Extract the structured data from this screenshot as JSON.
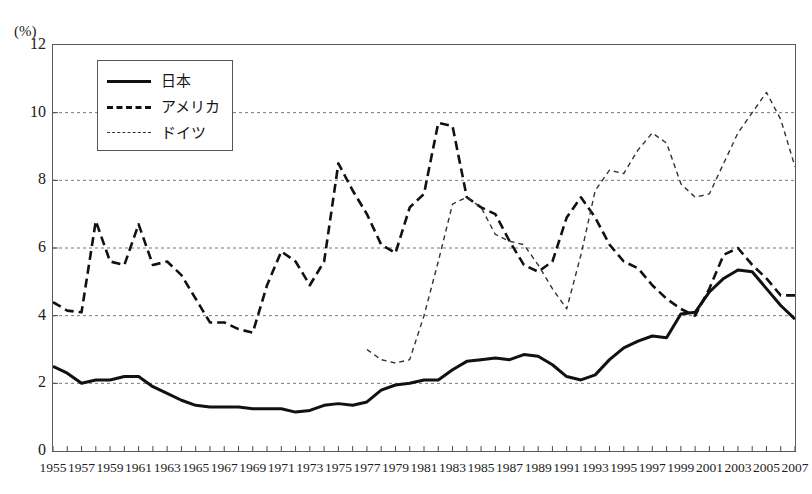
{
  "chart_data": {
    "type": "line",
    "title": "",
    "faint_top_text": "",
    "xlabel": "",
    "ylabel": "(%)",
    "ylim": [
      0,
      12
    ],
    "yticks": [
      0,
      2,
      4,
      6,
      8,
      10,
      12
    ],
    "xlim": [
      1955,
      2007
    ],
    "grid": "horizontal-dashed",
    "legend_position": "top-left-inside",
    "x": [
      1955,
      1956,
      1957,
      1958,
      1959,
      1960,
      1961,
      1962,
      1963,
      1964,
      1965,
      1966,
      1967,
      1968,
      1969,
      1970,
      1971,
      1972,
      1973,
      1974,
      1975,
      1976,
      1977,
      1978,
      1979,
      1980,
      1981,
      1982,
      1983,
      1984,
      1985,
      1986,
      1987,
      1988,
      1989,
      1990,
      1991,
      1992,
      1993,
      1994,
      1995,
      1996,
      1997,
      1998,
      1999,
      2000,
      2001,
      2002,
      2003,
      2004,
      2005,
      2006,
      2007
    ],
    "series": [
      {
        "name": "日本",
        "style": "solid",
        "color": "#111111",
        "values": [
          2.5,
          2.3,
          2.0,
          2.1,
          2.1,
          2.2,
          2.2,
          1.9,
          1.7,
          1.5,
          1.35,
          1.3,
          1.3,
          1.3,
          1.25,
          1.25,
          1.25,
          1.15,
          1.2,
          1.35,
          1.4,
          1.35,
          1.45,
          1.8,
          1.95,
          2.0,
          2.1,
          2.1,
          2.4,
          2.65,
          2.7,
          2.75,
          2.7,
          2.85,
          2.8,
          2.55,
          2.2,
          2.1,
          2.25,
          2.7,
          3.05,
          3.25,
          3.4,
          3.35,
          4.05,
          4.1,
          4.7,
          5.1,
          5.35,
          5.3,
          4.8,
          4.3,
          3.9
        ]
      },
      {
        "name": "アメリカ",
        "style": "dashed",
        "color": "#111111",
        "values": [
          4.4,
          4.15,
          4.1,
          6.8,
          5.6,
          5.5,
          6.7,
          5.5,
          5.6,
          5.2,
          4.5,
          3.8,
          3.8,
          3.6,
          3.5,
          4.9,
          5.9,
          5.6,
          4.9,
          5.6,
          8.5,
          7.7,
          7.0,
          6.1,
          5.85,
          7.2,
          7.6,
          9.7,
          9.6,
          7.5,
          7.2,
          7.0,
          6.2,
          5.5,
          5.3,
          5.6,
          6.9,
          7.5,
          6.9,
          6.1,
          5.6,
          5.4,
          4.9,
          4.5,
          4.2,
          4.0,
          4.8,
          5.8,
          6.0,
          5.5,
          5.1,
          4.6,
          4.6
        ]
      },
      {
        "name": "ドイツ",
        "style": "dotted",
        "color": "#333333",
        "values": [
          null,
          null,
          null,
          null,
          null,
          null,
          null,
          null,
          null,
          null,
          null,
          null,
          null,
          null,
          null,
          null,
          null,
          null,
          null,
          null,
          null,
          null,
          3.0,
          2.7,
          2.6,
          2.7,
          4.0,
          5.6,
          7.3,
          7.5,
          7.2,
          6.4,
          6.2,
          6.1,
          5.5,
          4.8,
          4.2,
          5.8,
          7.7,
          8.3,
          8.2,
          8.9,
          9.4,
          9.1,
          7.9,
          7.5,
          7.6,
          8.5,
          9.4,
          10.0,
          10.6,
          9.8,
          8.4
        ]
      }
    ],
    "xtick_labels": [
      "1955",
      "1957",
      "1959",
      "1961",
      "1963",
      "1965",
      "1967",
      "1969",
      "1971",
      "1973",
      "1975",
      "1977",
      "1979",
      "1981",
      "1983",
      "1985",
      "1987",
      "1989",
      "1991",
      "1993",
      "1995",
      "1997",
      "1999",
      "2001",
      "2003",
      "2005",
      "2007"
    ]
  }
}
